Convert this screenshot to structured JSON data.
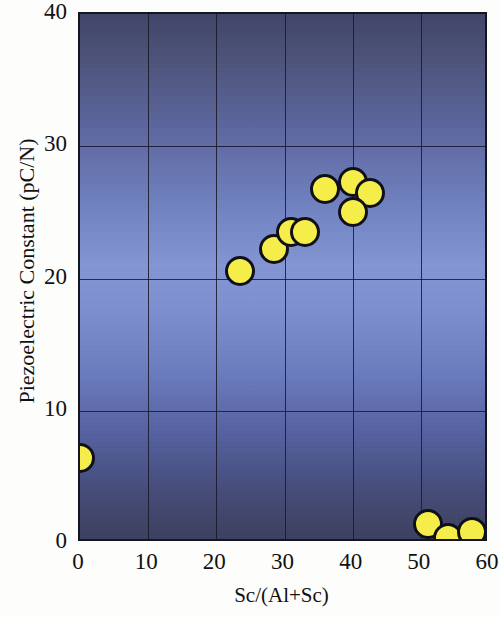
{
  "chart_data": {
    "type": "scatter",
    "title": "",
    "xlabel": "Sc/(Al+Sc)",
    "ylabel": "Piezoelectric Constant (pC/N)",
    "xlim": [
      0,
      60
    ],
    "ylim": [
      0,
      40
    ],
    "xticks": [
      0,
      10,
      20,
      30,
      40,
      50,
      60
    ],
    "yticks": [
      0,
      10,
      20,
      30,
      40
    ],
    "xtick_labels": [
      "0",
      "10",
      "20",
      "30",
      "40",
      "50",
      "60"
    ],
    "ytick_labels": [
      "0",
      "10",
      "20",
      "30",
      "40"
    ],
    "grid": true,
    "legend": null,
    "marker": {
      "shape": "circle",
      "fill_color": "#f5ee4a",
      "edge_color": "#101018",
      "size_px": 30
    },
    "background": {
      "top_color": "#3f4468",
      "mid_color": "#8396d4",
      "bottom_color": "#3b3f60"
    },
    "series": [
      {
        "name": "AlScN piezoelectric constant",
        "points": [
          {
            "x": 0,
            "y": 6.4
          },
          {
            "x": 23.5,
            "y": 20.6
          },
          {
            "x": 28.5,
            "y": 22.2
          },
          {
            "x": 31.0,
            "y": 23.5
          },
          {
            "x": 33.0,
            "y": 23.5
          },
          {
            "x": 36.0,
            "y": 26.8
          },
          {
            "x": 40.0,
            "y": 27.3
          },
          {
            "x": 42.5,
            "y": 26.5
          },
          {
            "x": 40.0,
            "y": 25.0
          },
          {
            "x": 51.0,
            "y": 1.4
          },
          {
            "x": 54.0,
            "y": 0.4
          },
          {
            "x": 57.5,
            "y": 0.8
          }
        ]
      }
    ]
  }
}
